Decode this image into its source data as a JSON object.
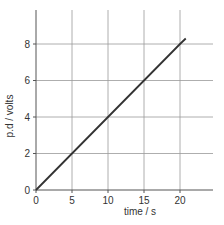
{
  "chart_data": {
    "type": "line",
    "title": "",
    "xlabel": "time / s",
    "ylabel": "p.d / volts",
    "xlim": [
      0,
      25
    ],
    "ylim": [
      0,
      10
    ],
    "x_ticks": [
      0,
      5,
      10,
      15,
      20
    ],
    "y_ticks": [
      0,
      2,
      4,
      6,
      8
    ],
    "grid": true,
    "legend": null,
    "series": [
      {
        "name": "p.d vs time",
        "x": [
          0,
          5,
          10,
          15,
          20,
          20.8
        ],
        "y": [
          0,
          2,
          4,
          6,
          8,
          8.3
        ]
      }
    ]
  },
  "colors": {
    "axis": "#555555",
    "grid": "#999999",
    "line": "#333333",
    "text": "#333333"
  }
}
